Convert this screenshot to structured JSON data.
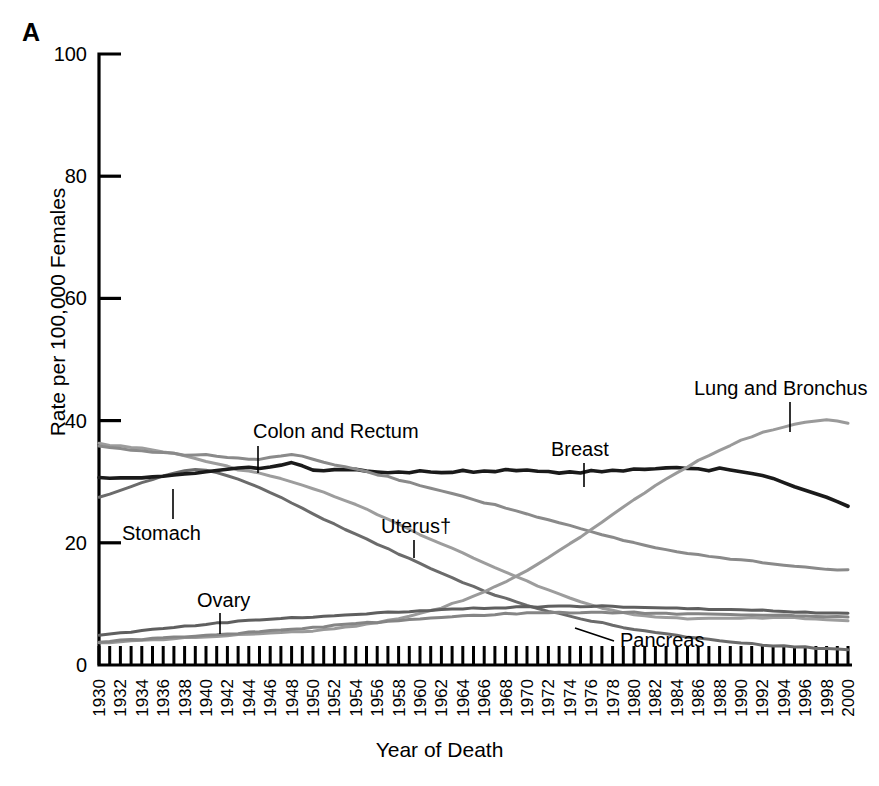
{
  "panel": {
    "label": "A"
  },
  "axes": {
    "ylabel": "Rate per 100,000 Females",
    "xlabel": "Year of Death",
    "ytick_labels": [
      "100",
      "80",
      "60",
      "40",
      "20",
      "0"
    ],
    "ytick_values": [
      100,
      80,
      60,
      40,
      20,
      0
    ],
    "xtick_labels": [
      "1930",
      "1932",
      "1934",
      "1936",
      "1938",
      "1940",
      "1942",
      "1944",
      "1946",
      "1948",
      "1950",
      "1952",
      "1954",
      "1956",
      "1958",
      "1960",
      "1962",
      "1964",
      "1966",
      "1968",
      "1970",
      "1972",
      "1974",
      "1976",
      "1978",
      "1980",
      "1982",
      "1984",
      "1986",
      "1988",
      "1990",
      "1992",
      "1994",
      "1996",
      "1998",
      "2000"
    ]
  },
  "annotations": [
    {
      "name": "colon-and-rectum",
      "text": "Colon and Rectum",
      "x": 253,
      "y": 438,
      "leader_x": 258,
      "leader_y1": 446,
      "leader_y2": 473
    },
    {
      "name": "stomach",
      "text": "Stomach",
      "x": 122,
      "y": 540,
      "leader_x": 173,
      "leader_y1": 489,
      "leader_y2": 519
    },
    {
      "name": "ovary",
      "text": "Ovary",
      "x": 197,
      "y": 607,
      "leader_x": 220,
      "leader_y1": 613,
      "leader_y2": 634
    },
    {
      "name": "uterus",
      "text": "Uterus†",
      "x": 381,
      "y": 533,
      "leader_x": 414,
      "leader_y1": 540,
      "leader_y2": 558
    },
    {
      "name": "breast",
      "text": "Breast",
      "x": 551,
      "y": 456,
      "leader_x": 584,
      "leader_y1": 463,
      "leader_y2": 487
    },
    {
      "name": "lung-and-bronchus",
      "text": "Lung and Bronchus",
      "x": 694,
      "y": 395,
      "leader_x": 790,
      "leader_y1": 402,
      "leader_y2": 432
    },
    {
      "name": "pancreas",
      "text": "Pancreas",
      "x": 620,
      "y": 647,
      "leader_x": 0,
      "leader_y1": 0,
      "leader_y2": 0
    }
  ],
  "chart_data": {
    "type": "line",
    "title": "",
    "xlabel": "Year of Death",
    "ylabel": "Rate per 100,000 Females",
    "xlim": [
      1930,
      2000
    ],
    "ylim": [
      0,
      100
    ],
    "grid": false,
    "legend": "inline annotations",
    "x": [
      1930,
      1931,
      1932,
      1933,
      1934,
      1935,
      1936,
      1937,
      1938,
      1939,
      1940,
      1941,
      1942,
      1943,
      1944,
      1945,
      1946,
      1947,
      1948,
      1949,
      1950,
      1951,
      1952,
      1953,
      1954,
      1955,
      1956,
      1957,
      1958,
      1959,
      1960,
      1961,
      1962,
      1963,
      1964,
      1965,
      1966,
      1967,
      1968,
      1969,
      1970,
      1971,
      1972,
      1973,
      1974,
      1975,
      1976,
      1977,
      1978,
      1979,
      1980,
      1981,
      1982,
      1983,
      1984,
      1985,
      1986,
      1987,
      1988,
      1989,
      1990,
      1991,
      1992,
      1993,
      1994,
      1995,
      1996,
      1997,
      1998,
      1999,
      2000
    ],
    "series": [
      {
        "name": "Uterus†",
        "color": "#9d9d9d",
        "values": [
          36.2,
          36.0,
          35.8,
          35.6,
          35.5,
          35.2,
          34.9,
          34.6,
          34.2,
          33.8,
          33.4,
          33.0,
          32.5,
          32.0,
          31.8,
          31.4,
          31.0,
          30.5,
          30.0,
          29.4,
          28.9,
          28.3,
          27.6,
          26.9,
          26.2,
          25.5,
          24.6,
          23.8,
          23.0,
          22.2,
          21.4,
          20.6,
          19.8,
          19.1,
          18.3,
          17.5,
          16.8,
          16.0,
          15.2,
          14.5,
          13.8,
          13.0,
          12.3,
          11.6,
          11.0,
          10.4,
          9.8,
          9.3,
          8.9,
          8.5,
          8.2,
          8.0,
          7.9,
          7.8,
          7.7,
          7.6,
          7.6,
          7.6,
          7.6,
          7.6,
          7.6,
          7.7,
          7.7,
          7.7,
          7.7,
          7.7,
          7.6,
          7.5,
          7.4,
          7.3,
          7.2
        ]
      },
      {
        "name": "Stomach",
        "color": "#6b6b6b",
        "values": [
          27.4,
          28.0,
          28.6,
          29.2,
          29.8,
          30.4,
          31.0,
          31.4,
          31.8,
          32.0,
          31.8,
          31.5,
          31.0,
          30.4,
          29.8,
          29.0,
          28.2,
          27.4,
          26.6,
          25.7,
          24.8,
          23.9,
          23.0,
          22.2,
          21.5,
          20.6,
          19.8,
          19.0,
          18.2,
          17.4,
          16.6,
          15.8,
          15.0,
          14.3,
          13.5,
          12.8,
          12.1,
          11.5,
          10.9,
          10.3,
          9.8,
          9.3,
          8.8,
          8.4,
          8.0,
          7.6,
          7.2,
          6.9,
          6.5,
          6.2,
          5.9,
          5.6,
          5.3,
          5.1,
          4.8,
          4.6,
          4.4,
          4.2,
          4.0,
          3.8,
          3.6,
          3.5,
          3.3,
          3.2,
          3.1,
          3.0,
          2.9,
          2.8,
          2.7,
          2.6,
          2.5
        ]
      },
      {
        "name": "Breast",
        "color": "#1a1a1a",
        "values": [
          30.6,
          30.5,
          30.6,
          30.6,
          30.7,
          30.8,
          30.9,
          31.1,
          31.3,
          31.4,
          31.6,
          31.9,
          32.1,
          32.2,
          32.4,
          32.2,
          32.5,
          32.7,
          33.2,
          32.6,
          31.9,
          31.8,
          31.9,
          31.9,
          32.0,
          31.8,
          31.6,
          31.4,
          31.6,
          31.5,
          31.7,
          31.6,
          31.4,
          31.5,
          31.8,
          31.6,
          31.8,
          31.7,
          32.0,
          31.8,
          31.9,
          31.7,
          31.6,
          31.4,
          31.6,
          31.5,
          31.8,
          31.7,
          31.9,
          31.8,
          32.1,
          32.0,
          32.1,
          32.2,
          32.3,
          32.2,
          32.2,
          31.8,
          32.2,
          32.0,
          31.7,
          31.4,
          31.0,
          30.5,
          29.9,
          29.2,
          28.6,
          28.0,
          27.5,
          26.8,
          26.0
        ]
      },
      {
        "name": "Colon and Rectum",
        "color": "#8a8a8a",
        "values": [
          35.8,
          35.6,
          35.4,
          35.2,
          35.1,
          34.9,
          34.8,
          34.6,
          34.4,
          34.3,
          34.4,
          34.2,
          34.0,
          33.8,
          33.6,
          33.6,
          34.0,
          34.2,
          34.4,
          34.1,
          33.6,
          33.2,
          32.8,
          32.4,
          32.0,
          31.6,
          31.2,
          30.8,
          30.3,
          29.9,
          29.4,
          29.0,
          28.5,
          28.0,
          27.6,
          27.1,
          26.6,
          26.2,
          25.7,
          25.2,
          24.7,
          24.2,
          23.7,
          23.2,
          22.8,
          22.3,
          21.8,
          21.3,
          20.9,
          20.4,
          20.0,
          19.6,
          19.2,
          18.9,
          18.6,
          18.3,
          18.0,
          17.8,
          17.6,
          17.4,
          17.2,
          17.0,
          16.8,
          16.6,
          16.4,
          16.2,
          16.0,
          15.9,
          15.7,
          15.6,
          15.5
        ]
      },
      {
        "name": "Lung and Bronchus",
        "color": "#9a9a9a",
        "values": [
          3.6,
          3.7,
          3.8,
          3.9,
          4.0,
          4.1,
          4.2,
          4.3,
          4.4,
          4.5,
          4.6,
          4.7,
          4.8,
          4.9,
          5.0,
          5.1,
          5.2,
          5.3,
          5.4,
          5.5,
          5.6,
          5.8,
          6.0,
          6.2,
          6.4,
          6.7,
          7.0,
          7.3,
          7.6,
          8.0,
          8.4,
          8.9,
          9.4,
          10.0,
          10.6,
          11.3,
          12.0,
          12.8,
          13.6,
          14.5,
          15.5,
          16.5,
          17.6,
          18.7,
          19.8,
          21.0,
          22.2,
          23.4,
          24.6,
          25.8,
          27.0,
          28.2,
          29.3,
          30.4,
          31.4,
          32.4,
          33.4,
          34.3,
          35.2,
          36.0,
          36.8,
          37.4,
          38.0,
          38.5,
          39.0,
          39.4,
          39.7,
          40.0,
          40.1,
          40.0,
          39.6
        ]
      },
      {
        "name": "Ovary",
        "color": "#5f5f5f",
        "values": [
          4.8,
          5.0,
          5.2,
          5.4,
          5.6,
          5.8,
          6.0,
          6.2,
          6.4,
          6.5,
          6.7,
          6.9,
          7.0,
          7.2,
          7.3,
          7.4,
          7.5,
          7.6,
          7.7,
          7.8,
          7.9,
          8.0,
          8.1,
          8.2,
          8.3,
          8.4,
          8.5,
          8.6,
          8.7,
          8.8,
          8.9,
          9.0,
          9.1,
          9.2,
          9.2,
          9.3,
          9.3,
          9.4,
          9.4,
          9.5,
          9.5,
          9.5,
          9.6,
          9.6,
          9.6,
          9.6,
          9.6,
          9.6,
          9.6,
          9.5,
          9.5,
          9.4,
          9.4,
          9.3,
          9.3,
          9.2,
          9.2,
          9.1,
          9.1,
          9.0,
          9.0,
          8.9,
          8.9,
          8.8,
          8.8,
          8.7,
          8.7,
          8.6,
          8.6,
          8.5,
          8.5
        ]
      },
      {
        "name": "Pancreas",
        "color": "#858585",
        "values": [
          3.8,
          3.9,
          4.0,
          4.1,
          4.2,
          4.3,
          4.4,
          4.5,
          4.6,
          4.7,
          4.9,
          5.0,
          5.1,
          5.2,
          5.4,
          5.5,
          5.6,
          5.8,
          5.9,
          6.0,
          6.2,
          6.3,
          6.5,
          6.6,
          6.8,
          6.9,
          7.0,
          7.2,
          7.3,
          7.4,
          7.5,
          7.7,
          7.8,
          7.9,
          8.0,
          8.1,
          8.2,
          8.3,
          8.4,
          8.4,
          8.5,
          8.5,
          8.6,
          8.6,
          8.6,
          8.6,
          8.6,
          8.6,
          8.6,
          8.6,
          8.6,
          8.5,
          8.5,
          8.5,
          8.4,
          8.4,
          8.4,
          8.3,
          8.3,
          8.3,
          8.2,
          8.2,
          8.2,
          8.1,
          8.1,
          8.1,
          8.0,
          8.0,
          7.9,
          7.9,
          7.8
        ]
      }
    ]
  }
}
